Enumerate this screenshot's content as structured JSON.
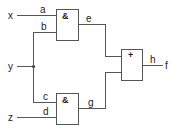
{
  "diagram": {
    "type": "logic-circuit",
    "inputs": [
      {
        "id": "x",
        "label": "x"
      },
      {
        "id": "y",
        "label": "y"
      },
      {
        "id": "z",
        "label": "z"
      }
    ],
    "output": {
      "id": "f",
      "label": "f"
    },
    "gates": [
      {
        "id": "and_top",
        "symbol": "&",
        "inputs": [
          "a",
          "b"
        ],
        "output": "e"
      },
      {
        "id": "and_bottom",
        "symbol": "&",
        "inputs": [
          "c",
          "d"
        ],
        "output": "g"
      },
      {
        "id": "or_gate",
        "symbol": "+",
        "inputs": [
          "e",
          "g"
        ],
        "output": "h"
      }
    ],
    "wires": {
      "a": "a",
      "b": "b",
      "c": "c",
      "d": "d",
      "e": "e",
      "g": "g",
      "h": "h"
    }
  }
}
